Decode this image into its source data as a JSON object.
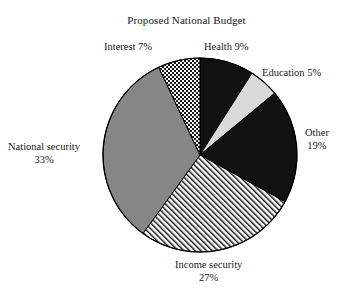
{
  "chart_data": {
    "type": "pie",
    "title": "Proposed National Budget",
    "xlabel": "",
    "ylabel": "",
    "legend_position": "none",
    "grid": false,
    "start_angle_deg": 0,
    "direction": "clockwise",
    "categories": [
      "Health",
      "Education",
      "Other",
      "Income security",
      "National security",
      "Interest"
    ],
    "values": [
      9,
      5,
      19,
      27,
      33,
      7
    ],
    "units": "percent",
    "slices": [
      {
        "name": "Health",
        "value": 9,
        "value_label": "9%",
        "label_text": "Health 9%",
        "fill": "solid-black",
        "color": "#111111",
        "start_deg": 0,
        "end_deg": 32.4
      },
      {
        "name": "Education",
        "value": 5,
        "value_label": "5%",
        "label_text": "Education 5%",
        "fill": "solid-light-gray",
        "color": "#d9d9d9",
        "start_deg": 32.4,
        "end_deg": 50.4
      },
      {
        "name": "Other",
        "value": 19,
        "value_label": "19%",
        "label_line1": "Other",
        "label_line2": "19%",
        "fill": "solid-black",
        "color": "#111111",
        "start_deg": 50.4,
        "end_deg": 118.8
      },
      {
        "name": "Income security",
        "value": 27,
        "value_label": "27%",
        "label_line1": "Income security",
        "label_line2": "27%",
        "fill": "diagonal-hatch",
        "color": "#ffffff",
        "start_deg": 118.8,
        "end_deg": 216.0
      },
      {
        "name": "National security",
        "value": 33,
        "value_label": "33%",
        "label_line1": "National security",
        "label_line2": "33%",
        "fill": "solid-gray",
        "color": "#868686",
        "start_deg": 216.0,
        "end_deg": 334.8
      },
      {
        "name": "Interest",
        "value": 7,
        "value_label": "7%",
        "label_text": "Interest 7%",
        "fill": "checkerboard",
        "color": "#ffffff",
        "start_deg": 334.8,
        "end_deg": 360.0
      }
    ],
    "total": 100,
    "outline_color": "#000000",
    "background": "#ffffff"
  }
}
